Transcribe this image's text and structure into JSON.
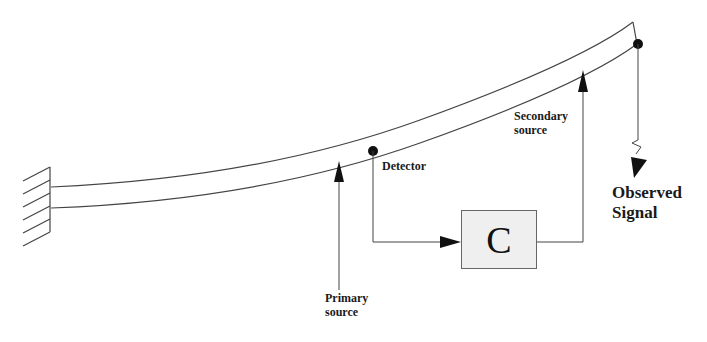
{
  "diagram": {
    "type": "active vibration control of cantilever beam",
    "labels": {
      "detector": "Detector",
      "primary_source_line1": "Primary",
      "primary_source_line2": "source",
      "secondary_source_line1": "Secondary",
      "secondary_source_line2": "source",
      "observed_line1": "Observed",
      "observed_line2": "Signal",
      "controller": "C"
    },
    "colors": {
      "line": "#444444",
      "dot": "#111111",
      "controller_fill": "#efefef",
      "background": "#ffffff"
    }
  }
}
